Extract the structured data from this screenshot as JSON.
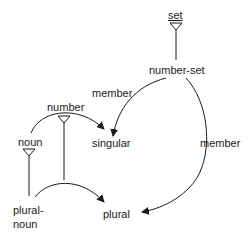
{
  "diagram": {
    "type": "semantic-network",
    "colors": {
      "ink": "#1a1a1a",
      "background": "#ffffff"
    },
    "nodes": [
      {
        "id": "set",
        "label": "set",
        "underlined": true,
        "has_triangle": true
      },
      {
        "id": "number-set",
        "label": "number-set"
      },
      {
        "id": "number",
        "label": "number",
        "has_triangle": true
      },
      {
        "id": "noun",
        "label": "noun",
        "has_triangle": true
      },
      {
        "id": "singular",
        "label": "singular"
      },
      {
        "id": "plural",
        "label": "plural"
      },
      {
        "id": "plural-noun",
        "label_line1": "plural-",
        "label_line2": "noun"
      }
    ],
    "edges": [
      {
        "from": "number-set",
        "to": "set",
        "kind": "isa-line"
      },
      {
        "from": "number-set",
        "to": "singular",
        "label": "member",
        "kind": "arrow"
      },
      {
        "from": "number-set",
        "to": "plural",
        "label": "member",
        "kind": "arrow"
      },
      {
        "from": "noun",
        "to": "singular",
        "kind": "arrow"
      },
      {
        "from": "plural-noun",
        "to": "noun",
        "kind": "isa-line"
      },
      {
        "from": "plural-noun",
        "to": "number",
        "kind": "isa-line"
      },
      {
        "from": "plural-noun",
        "to": "plural",
        "kind": "arrow"
      }
    ],
    "edge_labels": {
      "member_left": "member",
      "member_right": "member"
    }
  }
}
